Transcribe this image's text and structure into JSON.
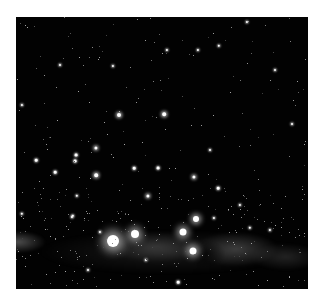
{
  "image": {
    "subject": "night sky starfield with Milky Way band",
    "frame_color": "#ffffff",
    "sky_color": "#020202"
  },
  "stars": [
    {
      "x": 113,
      "y": 241,
      "r": 6,
      "glow": 10
    },
    {
      "x": 135,
      "y": 234,
      "r": 4,
      "glow": 7
    },
    {
      "x": 183,
      "y": 232,
      "r": 3.5,
      "glow": 6
    },
    {
      "x": 196,
      "y": 219,
      "r": 3,
      "glow": 5
    },
    {
      "x": 193,
      "y": 251,
      "r": 3.5,
      "glow": 6
    },
    {
      "x": 119,
      "y": 115,
      "r": 2,
      "glow": 3
    },
    {
      "x": 164,
      "y": 114,
      "r": 1.8,
      "glow": 3
    },
    {
      "x": 96,
      "y": 148,
      "r": 1.6,
      "glow": 3
    },
    {
      "x": 76,
      "y": 155,
      "r": 1.4,
      "glow": 2
    },
    {
      "x": 75,
      "y": 161,
      "r": 1.4,
      "glow": 2
    },
    {
      "x": 36,
      "y": 160,
      "r": 1.3,
      "glow": 2
    },
    {
      "x": 55,
      "y": 172,
      "r": 1.3,
      "glow": 2
    },
    {
      "x": 96,
      "y": 175,
      "r": 1.8,
      "glow": 3
    },
    {
      "x": 134,
      "y": 168,
      "r": 1.3,
      "glow": 2
    },
    {
      "x": 158,
      "y": 168,
      "r": 1.4,
      "glow": 2
    },
    {
      "x": 194,
      "y": 177,
      "r": 1.6,
      "glow": 3
    },
    {
      "x": 148,
      "y": 196,
      "r": 1.6,
      "glow": 3
    },
    {
      "x": 218,
      "y": 188,
      "r": 1.3,
      "glow": 2
    },
    {
      "x": 219,
      "y": 46,
      "r": 1.2,
      "glow": 2
    },
    {
      "x": 167,
      "y": 50,
      "r": 1.1,
      "glow": 2
    },
    {
      "x": 198,
      "y": 50,
      "r": 1.1,
      "glow": 2
    },
    {
      "x": 113,
      "y": 66,
      "r": 1.1,
      "glow": 2
    },
    {
      "x": 247,
      "y": 22,
      "r": 1.1,
      "glow": 2
    },
    {
      "x": 22,
      "y": 214,
      "r": 1.2,
      "glow": 2
    },
    {
      "x": 77,
      "y": 196,
      "r": 1.2,
      "glow": 2
    },
    {
      "x": 250,
      "y": 228,
      "r": 1.2,
      "glow": 2
    },
    {
      "x": 240,
      "y": 205,
      "r": 1.1,
      "glow": 2
    },
    {
      "x": 73,
      "y": 216,
      "r": 1.2,
      "glow": 2
    },
    {
      "x": 22,
      "y": 105,
      "r": 1.1,
      "glow": 2
    },
    {
      "x": 292,
      "y": 124,
      "r": 1.0,
      "glow": 2
    },
    {
      "x": 178,
      "y": 282,
      "r": 1.3,
      "glow": 2
    },
    {
      "x": 72,
      "y": 217,
      "r": 1.1,
      "glow": 2
    },
    {
      "x": 100,
      "y": 232,
      "r": 1.1,
      "glow": 2
    },
    {
      "x": 214,
      "y": 218,
      "r": 1.1,
      "glow": 2
    },
    {
      "x": 270,
      "y": 230,
      "r": 1.1,
      "glow": 2
    },
    {
      "x": 210,
      "y": 150,
      "r": 1.0,
      "glow": 2
    },
    {
      "x": 60,
      "y": 65,
      "r": 1.0,
      "glow": 2
    },
    {
      "x": 275,
      "y": 70,
      "r": 1.0,
      "glow": 2
    },
    {
      "x": 146,
      "y": 260,
      "r": 1.1,
      "glow": 2
    },
    {
      "x": 88,
      "y": 270,
      "r": 1.0,
      "glow": 2
    }
  ]
}
